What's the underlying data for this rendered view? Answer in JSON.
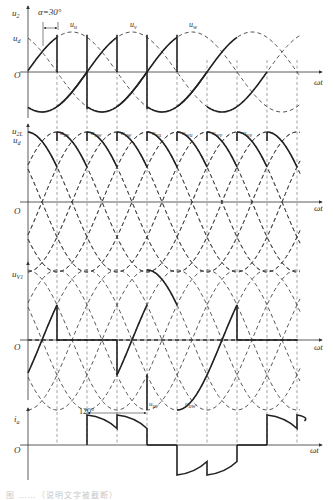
{
  "figure": {
    "panels": [
      {
        "id": "phase-voltage",
        "y_label": "u",
        "y_label_sub": "2",
        "level_label": "u",
        "level_label_sub": "d",
        "origin_label": "O",
        "x_label": "ωt",
        "alpha_label": "α=30°",
        "curve_labels": [
          {
            "main": "u",
            "sub": "u"
          },
          {
            "main": "u",
            "sub": "v"
          },
          {
            "main": "u",
            "sub": "w"
          }
        ]
      },
      {
        "id": "line-voltage",
        "y_label": "u",
        "y_label_sub": "2L",
        "level_label": "u",
        "level_label_sub": "d",
        "origin_label": "O",
        "x_label": "ωt",
        "curve_labels": [
          {
            "main": "u",
            "sub": "uv"
          },
          {
            "main": "u",
            "sub": "uw"
          },
          {
            "main": "u",
            "sub": "vw"
          },
          {
            "main": "u",
            "sub": "vu"
          },
          {
            "main": "u",
            "sub": "wu"
          },
          {
            "main": "u",
            "sub": "wv"
          },
          {
            "main": "u",
            "sub": "uv"
          }
        ]
      },
      {
        "id": "thyristor-voltage",
        "y_label": "u",
        "y_label_sub": "V1",
        "origin_label": "O",
        "x_label": "ωt",
        "curve_labels": [
          {
            "main": "u",
            "sub": "uv"
          },
          {
            "main": "u",
            "sub": "uw"
          }
        ]
      },
      {
        "id": "phase-current",
        "y_label": "i",
        "y_label_sub": "a",
        "origin_label": "O",
        "x_label": "ωt",
        "interval_label": "120°"
      }
    ],
    "caption": "图 ……（说明文字被截断）"
  }
}
